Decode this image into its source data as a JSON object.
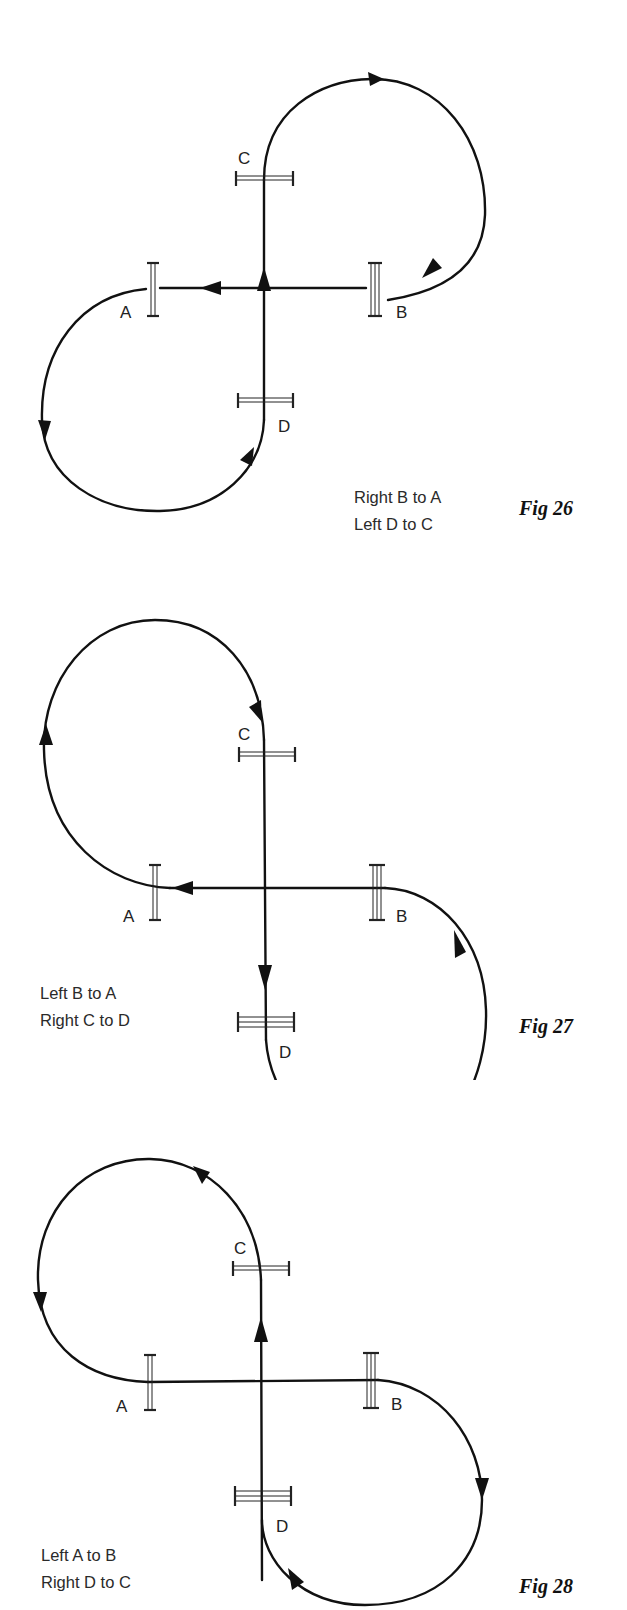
{
  "figures": [
    {
      "id": "fig26",
      "label": "Fig 26",
      "instructions": [
        "Right B to A",
        "Left D to C"
      ],
      "switch_labels": {
        "A": "A",
        "B": "B",
        "C": "C",
        "D": "D"
      },
      "route": "Top-right loop from C clockwise to B; B to A along straight; bottom-left loop from A counter-clockwise to D; D up to C"
    },
    {
      "id": "fig27",
      "label": "Fig 27",
      "instructions": [
        "Left B to A",
        "Right C to D"
      ],
      "switch_labels": {
        "A": "A",
        "B": "B",
        "C": "C",
        "D": "D"
      },
      "route": "Top-left loop from A clockwise to C; C down to D; bottom-right loop from D counter-clockwise to B; B to A along straight"
    },
    {
      "id": "fig28",
      "label": "Fig 28",
      "instructions": [
        "Left A to B",
        "Right D to C"
      ],
      "switch_labels": {
        "A": "A",
        "B": "B",
        "C": "C",
        "D": "D"
      },
      "route": "Top-left loop from C counter-clockwise to A; A to B along straight; bottom-right loop from B clockwise to D; D up to C"
    }
  ],
  "colors": {
    "line": "#111111",
    "background": "#ffffff"
  }
}
